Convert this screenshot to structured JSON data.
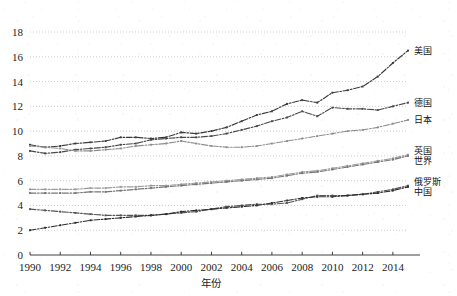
{
  "chart_data": {
    "type": "line",
    "title": "",
    "subtitle": "",
    "xlabel": "年份",
    "ylabel": "",
    "xlim": [
      1990,
      2015
    ],
    "ylim": [
      0,
      18
    ],
    "grid": true,
    "grid_axis": "y",
    "legend_position": "right-inline-labels",
    "x": [
      1990,
      1991,
      1992,
      1993,
      1994,
      1995,
      1996,
      1997,
      1998,
      1999,
      2000,
      2001,
      2002,
      2003,
      2004,
      2005,
      2006,
      2007,
      2008,
      2009,
      2010,
      2011,
      2012,
      2013,
      2014,
      2015
    ],
    "xticks": [
      1990,
      1992,
      1994,
      1996,
      1998,
      2000,
      2002,
      2004,
      2006,
      2008,
      2010,
      2012,
      2014
    ],
    "xtick_labels": [
      "1990",
      "1992",
      "1994",
      "1996",
      "1998",
      "2000",
      "2002",
      "2004",
      "2006",
      "2008",
      "2010",
      "2012",
      "2014"
    ],
    "yticks": [
      0,
      2,
      4,
      6,
      8,
      10,
      12,
      14,
      16,
      18
    ],
    "ytick_labels": [
      "0",
      "2",
      "4",
      "6",
      "8",
      "10",
      "12",
      "14",
      "16",
      "18"
    ],
    "series": [
      {
        "name": "美国",
        "color": "#3b3b3b",
        "values": [
          8.9,
          8.7,
          8.8,
          9.0,
          9.1,
          9.2,
          9.5,
          9.5,
          9.4,
          9.5,
          9.9,
          9.8,
          10.0,
          10.3,
          10.8,
          11.3,
          11.6,
          12.2,
          12.5,
          12.3,
          13.1,
          13.3,
          13.6,
          14.4,
          15.5,
          16.5
        ]
      },
      {
        "name": "德国",
        "color": "#4a4a4a",
        "values": [
          8.4,
          8.2,
          8.3,
          8.5,
          8.6,
          8.7,
          8.9,
          9.0,
          9.3,
          9.4,
          9.5,
          9.5,
          9.6,
          9.8,
          10.1,
          10.4,
          10.8,
          11.1,
          11.6,
          11.2,
          11.9,
          11.8,
          11.8,
          11.7,
          12.0,
          12.3
        ]
      },
      {
        "name": "日本",
        "color": "#8e8e8e",
        "values": [
          8.8,
          8.7,
          8.6,
          8.4,
          8.4,
          8.5,
          8.6,
          8.8,
          8.9,
          9.0,
          9.2,
          9.0,
          8.8,
          8.7,
          8.7,
          8.8,
          9.0,
          9.2,
          9.4,
          9.6,
          9.8,
          10.0,
          10.1,
          10.3,
          10.6,
          10.9
        ]
      },
      {
        "name": "英国",
        "color": "#9a9a9a",
        "values": [
          5.3,
          5.3,
          5.3,
          5.3,
          5.4,
          5.4,
          5.5,
          5.5,
          5.6,
          5.6,
          5.7,
          5.8,
          5.9,
          6.0,
          6.1,
          6.2,
          6.3,
          6.5,
          6.7,
          6.8,
          7.0,
          7.2,
          7.4,
          7.6,
          7.8,
          8.1
        ]
      },
      {
        "name": "世界",
        "color": "#757575",
        "values": [
          5.0,
          5.0,
          5.0,
          5.0,
          5.1,
          5.1,
          5.2,
          5.3,
          5.4,
          5.5,
          5.6,
          5.7,
          5.8,
          5.9,
          6.0,
          6.1,
          6.2,
          6.4,
          6.6,
          6.7,
          6.9,
          7.1,
          7.3,
          7.5,
          7.7,
          8.0
        ]
      },
      {
        "name": "俄罗斯",
        "color": "#555555",
        "values": [
          3.7,
          3.6,
          3.5,
          3.4,
          3.3,
          3.2,
          3.2,
          3.2,
          3.2,
          3.3,
          3.4,
          3.5,
          3.7,
          3.9,
          4.0,
          4.1,
          4.1,
          4.2,
          4.5,
          4.8,
          4.8,
          4.8,
          4.9,
          5.1,
          5.3,
          5.6
        ]
      },
      {
        "name": "中国",
        "color": "#2e2e2e",
        "values": [
          2.0,
          2.2,
          2.4,
          2.6,
          2.8,
          2.9,
          3.0,
          3.1,
          3.2,
          3.3,
          3.5,
          3.6,
          3.7,
          3.8,
          3.9,
          4.0,
          4.2,
          4.4,
          4.6,
          4.7,
          4.7,
          4.8,
          4.9,
          5.0,
          5.2,
          5.5
        ]
      }
    ],
    "series_labels": [
      {
        "text": "美国",
        "value_at_end": 16.5
      },
      {
        "text": "德国",
        "value_at_end": 12.3
      },
      {
        "text": "日本",
        "value_at_end": 10.9
      },
      {
        "text": "英国",
        "value_at_end": 8.1
      },
      {
        "text": "世界",
        "value_at_end": 8.0
      },
      {
        "text": "俄罗斯",
        "value_at_end": 5.6
      },
      {
        "text": "中国",
        "value_at_end": 5.5
      }
    ]
  }
}
